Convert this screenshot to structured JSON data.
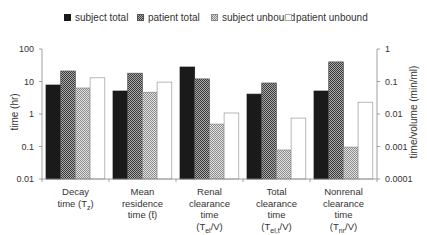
{
  "chart_data": {
    "type": "bar",
    "title": "",
    "categories": [
      "Decay time (T_z)",
      "Mean residence time (t̄)",
      "Renal clearance time (T_el/V)",
      "Total clearance time (T_el,t/V)",
      "Nonrenal clearance time (T_nr/V)"
    ],
    "category_lines": [
      [
        "Decay",
        "time (T",
        "z",
        ")"
      ],
      [
        "Mean",
        "residence",
        "time (t̄)"
      ],
      [
        "Renal",
        "clearance",
        "time",
        "(T",
        "el",
        "/V)"
      ],
      [
        "Total",
        "clearance",
        "time",
        "(T",
        "el,t",
        "/V)"
      ],
      [
        "Nonrenal",
        "clearance",
        "time",
        "(T",
        "nr",
        "/V)"
      ]
    ],
    "series": [
      {
        "name": "subject total",
        "values": [
          7.8,
          5.1,
          28,
          4.1,
          5.1
        ]
      },
      {
        "name": "patient total",
        "values": [
          21,
          18,
          12,
          9,
          40
        ]
      },
      {
        "name": "subject unbound",
        "values": [
          6.3,
          4.7,
          0.49,
          0.078,
          0.096
        ]
      },
      {
        "name": "patient unbound",
        "values": [
          13,
          9.6,
          1.07,
          0.75,
          2.3
        ]
      }
    ],
    "xlabel": "",
    "ylabel": "time (hr)",
    "ylabel_right": "time/volume (min/ml)",
    "yscale": "log",
    "ylim": [
      0.01,
      100
    ],
    "ylim_right": [
      0.0001,
      1
    ],
    "yticks": [
      "100",
      "10",
      "1",
      "0.1",
      "0.01"
    ],
    "yticks_right": [
      "1",
      "0.1",
      "0.01",
      "0.001",
      "0.0001"
    ],
    "grid": false,
    "legend_position": "top"
  },
  "legend": [
    {
      "label": "subject total"
    },
    {
      "label": "patient total"
    },
    {
      "label": "subject unbound"
    },
    {
      "label": "patient unbound"
    }
  ],
  "axes": {
    "left_title": "time (hr)",
    "right_title": "time/volume (min/ml)"
  }
}
